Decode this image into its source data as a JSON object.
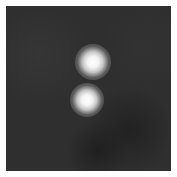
{
  "image": {
    "description": "Grayscale image of two bright point sources on a dark noisy background",
    "background_color": "#2f2f2f",
    "border_color": "#ffffff",
    "sources": [
      {
        "name": "upper-source",
        "cx": 93,
        "cy": 62,
        "radius": 18,
        "core": "#ffffff"
      },
      {
        "name": "lower-source",
        "cx": 87,
        "cy": 100,
        "radius": 17,
        "core": "#ffffff"
      }
    ]
  }
}
